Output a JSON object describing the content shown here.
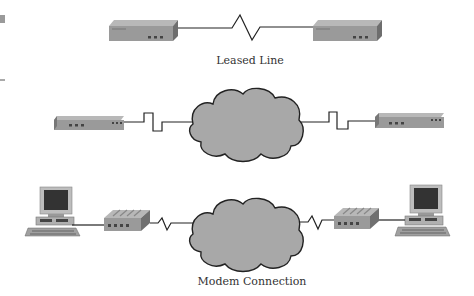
{
  "diagram": {
    "sections": [
      {
        "id": "leased-line",
        "label": "Leased Line",
        "nodes": [
          "router-left",
          "router-right"
        ],
        "link": "zigzag-line"
      },
      {
        "id": "packet-network",
        "label": "",
        "nodes": [
          "device-left",
          "cloud",
          "device-right"
        ],
        "link": "square-wave-line"
      },
      {
        "id": "modem-connection",
        "label": "Modem Connection",
        "nodes": [
          "computer-left",
          "modem-left",
          "cloud",
          "modem-right",
          "computer-right"
        ],
        "link": "zigzag-line"
      }
    ],
    "colors": {
      "device_face": "#9a9a9a",
      "device_top": "#b8b8b8",
      "device_side": "#707070",
      "cloud_fill": "#a8a8a8",
      "cloud_stroke": "#222222",
      "line": "#222222",
      "label_text": "#333333"
    }
  },
  "labels": {
    "leased_line": "Leased Line",
    "modem_connection": "Modem Connection"
  }
}
